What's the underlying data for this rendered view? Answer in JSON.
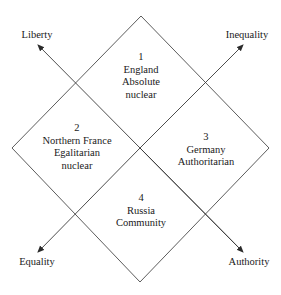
{
  "diagram": {
    "axes": {
      "liberty": "Liberty",
      "inequality": "Inequality",
      "equality": "Equality",
      "authority": "Authority"
    },
    "quadrants": [
      {
        "number": "1",
        "region": "England",
        "type_lines": [
          "Absolute",
          "nuclear"
        ]
      },
      {
        "number": "2",
        "region": "Northern France",
        "type_lines": [
          "Egalitarian",
          "nuclear"
        ]
      },
      {
        "number": "3",
        "region": "Germany",
        "type_lines": [
          "Authoritarian"
        ]
      },
      {
        "number": "4",
        "region": "Russia",
        "type_lines": [
          "Community"
        ]
      }
    ],
    "colors": {
      "line": "#3a3a3a",
      "text": "#1a1a1a",
      "background": "#ffffff"
    }
  }
}
